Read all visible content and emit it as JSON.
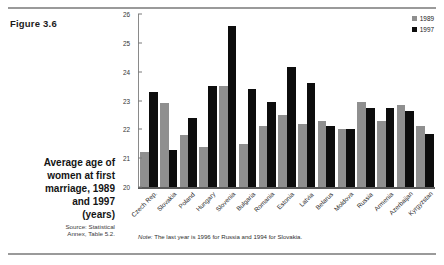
{
  "figure": {
    "number_label": "Figure 3.6",
    "title": "Average age of\nwomen at first\nmarriage, 1989\nand 1997",
    "title_lines": [
      "Average age of",
      "women at first",
      "marriage, 1989",
      "and 1997"
    ],
    "units": "(years)",
    "source_lines": [
      "Source: Statistical",
      "Annex, Table 5.2."
    ],
    "note_lead": "Note:",
    "note_text": "The last year is 1996 for Russia and 1994 for Slovakia."
  },
  "legend": {
    "items": [
      {
        "label": "1989",
        "color": "#8f8f8f"
      },
      {
        "label": "1997",
        "color": "#0d0d0d"
      }
    ]
  },
  "chart_data": {
    "type": "bar",
    "title": "Average age of women at first marriage, 1989 and 1997 (years)",
    "xlabel": "",
    "ylabel": "",
    "ylim": [
      20,
      26
    ],
    "yticks": [
      20,
      21,
      22,
      23,
      24,
      25,
      26
    ],
    "grid": false,
    "legend_position": "top-right",
    "categories": [
      "Czech Rep.",
      "Slovakia",
      "Poland",
      "Hungary",
      "Slovenia",
      "Bulgaria",
      "Romania",
      "Estonia",
      "Latvia",
      "Belarus",
      "Moldova",
      "Russia",
      "Armenia",
      "Azerbaijan",
      "Kyrgyzstan"
    ],
    "series": [
      {
        "name": "1989",
        "color": "#8f8f8f",
        "values": [
          21.2,
          22.9,
          21.8,
          21.4,
          23.5,
          21.5,
          22.1,
          22.5,
          22.2,
          22.3,
          22.0,
          22.95,
          22.3,
          22.85,
          22.1
        ]
      },
      {
        "name": "1997",
        "color": "#0d0d0d",
        "values": [
          23.3,
          21.3,
          22.4,
          23.5,
          25.6,
          23.4,
          22.95,
          24.15,
          23.6,
          22.1,
          22.0,
          22.75,
          22.75,
          22.65,
          21.85
        ]
      }
    ],
    "annotations": [
      "Note: The last year is 1996 for Russia and 1994 for Slovakia."
    ]
  }
}
